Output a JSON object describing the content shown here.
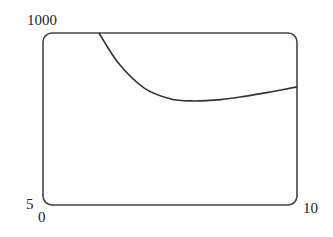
{
  "chart_data": {
    "type": "line",
    "title": "",
    "xlabel": "",
    "ylabel": "",
    "xlim": [
      0,
      10
    ],
    "ylim": [
      5,
      1000
    ],
    "x_tick_labels": [
      "0",
      "10"
    ],
    "y_tick_labels": [
      "5",
      "1000"
    ],
    "grid": false,
    "legend": null,
    "series": [
      {
        "name": "curve",
        "x": [
          2.2,
          3.0,
          4.0,
          5.0,
          5.8,
          7.0,
          8.0,
          9.0,
          10.0
        ],
        "y": [
          1000,
          820,
          680,
          620,
          607,
          615,
          635,
          660,
          688
        ]
      }
    ]
  },
  "labels": {
    "y_max": "1000",
    "y_min": "5",
    "x_min": "0",
    "x_max": "10"
  },
  "colors": {
    "line": "#333333",
    "frame": "#444444"
  }
}
